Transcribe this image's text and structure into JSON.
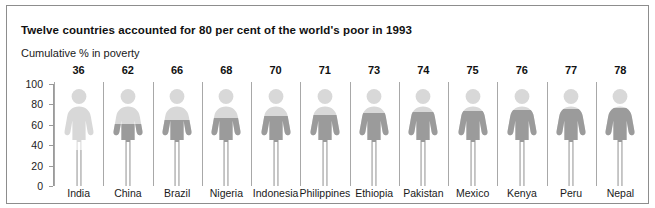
{
  "chart_data": {
    "type": "bar",
    "title": "Twelve countries accounted for 80 per cent of the world's poor in 1993",
    "subtitle": "Cumulative % in poverty",
    "xlabel": "",
    "ylabel": "Cumulative % in poverty",
    "ylim": [
      0,
      100
    ],
    "yticks": [
      0,
      20,
      40,
      60,
      80,
      100
    ],
    "grid": false,
    "legend": null,
    "categories": [
      "India",
      "China",
      "Brazil",
      "Nigeria",
      "Indonesia",
      "Philippines",
      "Ethiopia",
      "Pakistan",
      "Mexico",
      "Kenya",
      "Peru",
      "Nepal"
    ],
    "values": [
      36,
      62,
      66,
      68,
      70,
      71,
      73,
      74,
      75,
      76,
      77,
      78
    ],
    "value_labels": [
      "36",
      "62",
      "66",
      "68",
      "70",
      "71",
      "73",
      "74",
      "75",
      "76",
      "77",
      "78"
    ],
    "ytick_labels": [
      "100",
      "80",
      "60",
      "40",
      "20",
      "0"
    ],
    "marker": "person-pictogram",
    "colors": {
      "figure_empty": "#d8d8d8",
      "figure_filled": "#9b9b9b",
      "axis": "#9a9a9a",
      "divider": "#a8a8a8",
      "text": "#111111",
      "frame": "#8d8d8d",
      "background": "#ffffff"
    }
  }
}
